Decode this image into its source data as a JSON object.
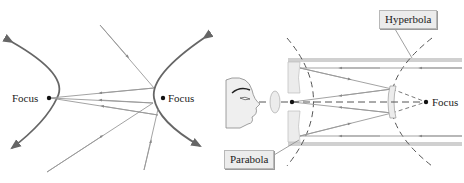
{
  "left_diagram": {
    "title": "hyperbola-reflection",
    "left_focus_label": "Focus",
    "right_focus_label": "Focus"
  },
  "right_diagram": {
    "title": "reflecting-telescope",
    "focus_label": "Focus",
    "hyperbola_label": "Hyperbola",
    "parabola_label": "Parabola"
  },
  "colors": {
    "curve": "#666666",
    "ray": "#999999",
    "tube": "#cfcfcf",
    "dash": "#555555",
    "text": "#222222",
    "callout_bg": "#ececec"
  }
}
